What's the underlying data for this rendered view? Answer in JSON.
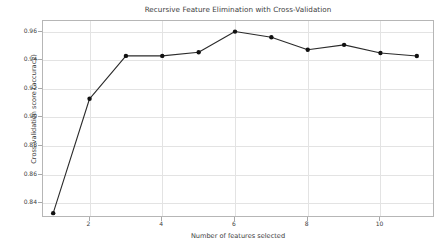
{
  "chart_data": {
    "type": "line",
    "title": "Recursive Feature Elimination with Cross-Validation",
    "xlabel": "Number of features selected",
    "ylabel": "Cross-validation score (accuracy)",
    "x": [
      1,
      2,
      3,
      4,
      5,
      6,
      7,
      8,
      9,
      10,
      11
    ],
    "values": [
      0.833,
      0.913,
      0.943,
      0.943,
      0.9455,
      0.96,
      0.956,
      0.9473,
      0.9507,
      0.945,
      0.9429
    ],
    "series": [
      {
        "name": "Cross-validation score",
        "values": [
          0.833,
          0.913,
          0.943,
          0.943,
          0.9455,
          0.96,
          0.956,
          0.9473,
          0.9507,
          0.945,
          0.9429
        ]
      }
    ],
    "xlim": [
      0.72,
      11.5
    ],
    "ylim": [
      0.8296,
      0.9674
    ],
    "xticks": [
      2,
      4,
      6,
      8,
      10
    ],
    "xtick_labels": [
      "2",
      "4",
      "6",
      "8",
      "10"
    ],
    "yticks": [
      0.84,
      0.86,
      0.88,
      0.9,
      0.92,
      0.94,
      0.96
    ],
    "ytick_labels": [
      "0.84",
      "0.86",
      "0.88",
      "0.90",
      "0.92",
      "0.94",
      "0.96"
    ],
    "grid": true,
    "legend": false,
    "line_color": "#2b2b2b",
    "marker_color": "#111111",
    "marker": "circle",
    "grid_color": "#e3e3e3",
    "frame_color": "#b6b6b6",
    "background": "#ffffff"
  }
}
